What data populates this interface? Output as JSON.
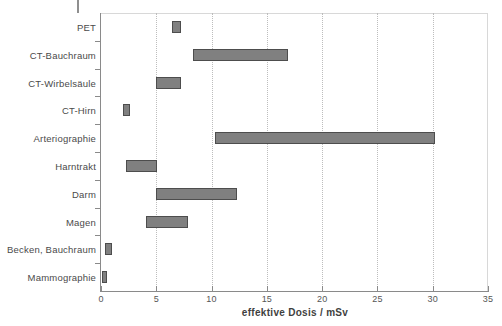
{
  "chart_data": {
    "type": "bar",
    "orientation": "horizontal",
    "subtype": "range-bar",
    "title": "",
    "xlabel": "effektive Dosis / mSv",
    "ylabel": "",
    "xlim": [
      0,
      35
    ],
    "xticks": [
      0,
      5,
      10,
      15,
      20,
      25,
      30,
      35
    ],
    "xtick_labels": [
      "0",
      "5",
      "10",
      "15",
      "20",
      "25",
      "30",
      "35"
    ],
    "grid": "vertical-dotted",
    "legend": "none",
    "categories": [
      "PET",
      "CT-Bauchraum",
      "CT-Wirbelsäule",
      "CT-Hirn",
      "Arteriographie",
      "Harntrakt",
      "Darm",
      "Magen",
      "Becken, Bauchraum",
      "Mammographie"
    ],
    "series": [
      {
        "name": "effektive Dosis Bereich",
        "color": "#808080",
        "ranges": [
          {
            "category": "PET",
            "low": 6.4,
            "high": 7.2
          },
          {
            "category": "CT-Bauchraum",
            "low": 8.3,
            "high": 16.9
          },
          {
            "category": "CT-Wirbelsäule",
            "low": 5.0,
            "high": 7.2
          },
          {
            "category": "CT-Hirn",
            "low": 2.0,
            "high": 2.6
          },
          {
            "category": "Arteriographie",
            "low": 10.3,
            "high": 30.2
          },
          {
            "category": "Harntrakt",
            "low": 2.3,
            "high": 5.1
          },
          {
            "category": "Darm",
            "low": 5.0,
            "high": 12.3
          },
          {
            "category": "Magen",
            "low": 4.1,
            "high": 7.9
          },
          {
            "category": "Becken, Bauchraum",
            "low": 0.4,
            "high": 1.0
          },
          {
            "category": "Mammographie",
            "low": 0.1,
            "high": 0.5
          }
        ]
      }
    ]
  },
  "colors": {
    "bar_fill": "#808080",
    "bar_border": "#4d4d4d",
    "axis": "#8a8a8a",
    "gridline": "#bdbdbd",
    "text": "#4a4a4a",
    "background": "#ffffff"
  }
}
